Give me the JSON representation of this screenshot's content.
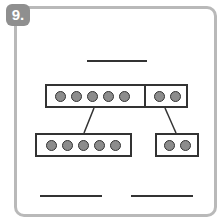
{
  "problem": {
    "number_label": "9.",
    "total_answer": "",
    "parts": [
      {
        "dots": 5,
        "answer": ""
      },
      {
        "dots": 2,
        "answer": ""
      }
    ],
    "whole": {
      "left_dots": 5,
      "right_dots": 2
    }
  },
  "colors": {
    "badge": "#8f8f8f",
    "border": "#b9b9b9",
    "dot": "#8c8c8c",
    "line": "#333333"
  }
}
